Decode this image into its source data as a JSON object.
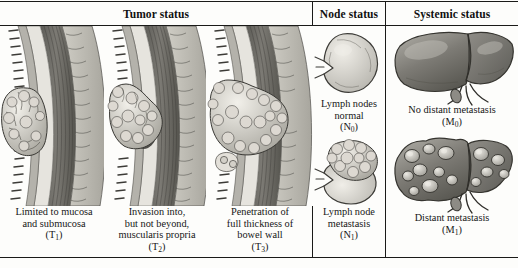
{
  "figure": {
    "columns": [
      {
        "id": "tumor",
        "header": "Tumor status"
      },
      {
        "id": "node",
        "header": "Node status"
      },
      {
        "id": "systemic",
        "header": "Systemic status"
      }
    ]
  },
  "tumor": {
    "panels": [
      {
        "id": "t1",
        "caption_lines": [
          "Limited to mucosa",
          "and submucosa"
        ],
        "code": "T",
        "code_sub": "1",
        "illustration": "bowel-wall-cross-section-tumor-mucosa-submucosa"
      },
      {
        "id": "t2",
        "caption_lines": [
          "Invasion into,",
          "but not beyond,",
          "muscularis propria"
        ],
        "code": "T",
        "code_sub": "2",
        "illustration": "bowel-wall-cross-section-tumor-muscularis-propria"
      },
      {
        "id": "t3",
        "caption_lines": [
          "Penetration of",
          "full thickness of",
          "bowel wall"
        ],
        "code": "T",
        "code_sub": "3",
        "illustration": "bowel-wall-cross-section-tumor-full-thickness"
      }
    ],
    "wall_layers": [
      "mucosa",
      "submucosa",
      "muscularis propria",
      "serosa"
    ]
  },
  "node": {
    "panels": [
      {
        "id": "n0",
        "caption_lines": [
          "Lymph nodes",
          "normal"
        ],
        "code": "N",
        "code_sub": "0",
        "illustration": "lymph-node-normal"
      },
      {
        "id": "n1",
        "caption_lines": [
          "Lymph node",
          "metastasis"
        ],
        "code": "N",
        "code_sub": "1",
        "illustration": "lymph-node-metastatic"
      }
    ]
  },
  "systemic": {
    "panels": [
      {
        "id": "m0",
        "caption_lines": [
          "No distant metastasis"
        ],
        "code": "M",
        "code_sub": "0",
        "illustration": "liver-normal"
      },
      {
        "id": "m1",
        "caption_lines": [
          "Distant metastasis"
        ],
        "code": "M",
        "code_sub": "1",
        "illustration": "liver-with-metastatic-nodules"
      }
    ]
  },
  "palette": {
    "ink": "#1a1a18",
    "page": "#fdfdfb",
    "mucosa": "#8e8e8a",
    "submucosa": "#e2e0da",
    "muscularis": "#6e6e69",
    "serosa": "#b9b7b0",
    "tumor_light": "#e9e7e1",
    "tumor_shade": "#a9a7a0",
    "organ_fill": "#9a9893",
    "organ_dark": "#6a6864"
  }
}
